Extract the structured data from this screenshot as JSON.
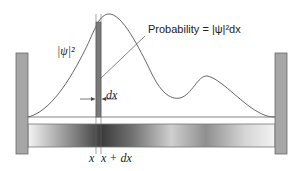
{
  "diagram": {
    "labels": {
      "psi_squared": "|ψ|²",
      "probability": "Probability = |ψ|²dx",
      "dx": "dx",
      "x": "x",
      "x_plus_dx": "x + dx"
    },
    "colors": {
      "wall": "#a6a6a6",
      "wall_border": "#6a6a6a",
      "strip": "#7a7a7a",
      "curve": "#555555",
      "bar_light": "#f2f2f2",
      "bar_dark": "#3a3a3a"
    }
  }
}
